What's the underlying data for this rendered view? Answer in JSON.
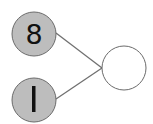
{
  "diagram": {
    "type": "number-bond",
    "parts": [
      {
        "label": "8",
        "fill": "#bdbdbd"
      },
      {
        "label": "1",
        "fill": "#bdbdbd"
      }
    ],
    "whole": {
      "label": "",
      "fill": "#ffffff"
    },
    "stroke_color": "#6b6b6b",
    "line_color": "#707070"
  }
}
